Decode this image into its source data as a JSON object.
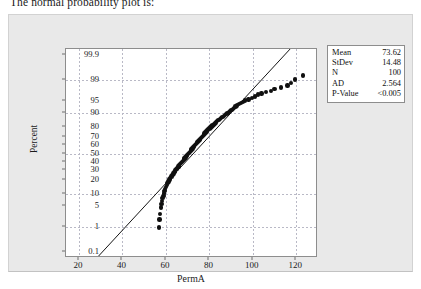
{
  "caption": "The normal probability plot is:",
  "chart_data": {
    "type": "scatter",
    "subtype": "normal-probability-plot",
    "title": "",
    "xlabel": "PermA",
    "ylabel": "Percent",
    "grid": true,
    "xlim": [
      14,
      130
    ],
    "xticks": [
      20,
      40,
      60,
      80,
      100,
      120
    ],
    "yticks": [
      0.1,
      1,
      5,
      10,
      20,
      30,
      40,
      50,
      60,
      70,
      80,
      90,
      95,
      99,
      99.9
    ],
    "ytick_labels": [
      "0.1",
      "1",
      "5",
      "10",
      "20",
      "30",
      "40",
      "50",
      "60",
      "70",
      "80",
      "90",
      "95",
      "99",
      "99.9"
    ],
    "ylim": [
      0.05,
      99.95
    ],
    "reference_line": {
      "label": "normal fit line",
      "mean": 73.62,
      "stdev": 14.48,
      "x_at_bottom": 29,
      "x_at_top": 118
    },
    "n_points": 100,
    "points": [
      {
        "x": 56.8,
        "y": 1.0
      },
      {
        "x": 57.0,
        "y": 1.9
      },
      {
        "x": 57.2,
        "y": 2.9
      },
      {
        "x": 57.6,
        "y": 4.5
      },
      {
        "x": 57.9,
        "y": 5.6
      },
      {
        "x": 58.2,
        "y": 6.8
      },
      {
        "x": 58.5,
        "y": 8.0
      },
      {
        "x": 58.8,
        "y": 9.2
      },
      {
        "x": 59.0,
        "y": 10.5
      },
      {
        "x": 59.3,
        "y": 11.8
      },
      {
        "x": 59.6,
        "y": 13.2
      },
      {
        "x": 60.0,
        "y": 14.6
      },
      {
        "x": 60.4,
        "y": 16.0
      },
      {
        "x": 60.8,
        "y": 17.5
      },
      {
        "x": 61.2,
        "y": 19.0
      },
      {
        "x": 61.6,
        "y": 20.5
      },
      {
        "x": 62.0,
        "y": 22.0
      },
      {
        "x": 62.5,
        "y": 23.5
      },
      {
        "x": 63.0,
        "y": 25.0
      },
      {
        "x": 63.4,
        "y": 26.5
      },
      {
        "x": 63.9,
        "y": 28.0
      },
      {
        "x": 64.3,
        "y": 29.5
      },
      {
        "x": 64.8,
        "y": 31.0
      },
      {
        "x": 65.2,
        "y": 32.5
      },
      {
        "x": 65.7,
        "y": 34.0
      },
      {
        "x": 66.1,
        "y": 35.4
      },
      {
        "x": 66.5,
        "y": 36.8
      },
      {
        "x": 67.0,
        "y": 38.2
      },
      {
        "x": 67.4,
        "y": 39.6
      },
      {
        "x": 67.8,
        "y": 41.0
      },
      {
        "x": 68.2,
        "y": 42.4
      },
      {
        "x": 68.6,
        "y": 43.8
      },
      {
        "x": 69.0,
        "y": 45.2
      },
      {
        "x": 69.4,
        "y": 46.6
      },
      {
        "x": 69.8,
        "y": 48.0
      },
      {
        "x": 70.2,
        "y": 49.4
      },
      {
        "x": 70.6,
        "y": 50.8
      },
      {
        "x": 71.0,
        "y": 52.2
      },
      {
        "x": 71.4,
        "y": 53.6
      },
      {
        "x": 71.8,
        "y": 55.0
      },
      {
        "x": 72.2,
        "y": 56.4
      },
      {
        "x": 72.6,
        "y": 57.8
      },
      {
        "x": 73.0,
        "y": 59.2
      },
      {
        "x": 73.4,
        "y": 60.5
      },
      {
        "x": 73.8,
        "y": 61.8
      },
      {
        "x": 74.2,
        "y": 63.0
      },
      {
        "x": 74.6,
        "y": 64.2
      },
      {
        "x": 75.0,
        "y": 65.4
      },
      {
        "x": 75.4,
        "y": 66.6
      },
      {
        "x": 75.8,
        "y": 67.8
      },
      {
        "x": 76.2,
        "y": 69.0
      },
      {
        "x": 76.6,
        "y": 70.1
      },
      {
        "x": 77.0,
        "y": 71.2
      },
      {
        "x": 77.4,
        "y": 72.3
      },
      {
        "x": 77.8,
        "y": 73.4
      },
      {
        "x": 78.2,
        "y": 74.5
      },
      {
        "x": 78.6,
        "y": 75.5
      },
      {
        "x": 79.0,
        "y": 76.5
      },
      {
        "x": 79.5,
        "y": 77.5
      },
      {
        "x": 80.0,
        "y": 78.5
      },
      {
        "x": 80.5,
        "y": 79.4
      },
      {
        "x": 81.0,
        "y": 80.3
      },
      {
        "x": 81.5,
        "y": 81.2
      },
      {
        "x": 82.0,
        "y": 82.1
      },
      {
        "x": 82.5,
        "y": 82.9
      },
      {
        "x": 83.0,
        "y": 83.7
      },
      {
        "x": 83.6,
        "y": 84.5
      },
      {
        "x": 84.2,
        "y": 85.3
      },
      {
        "x": 84.8,
        "y": 86.0
      },
      {
        "x": 85.4,
        "y": 86.7
      },
      {
        "x": 86.0,
        "y": 87.4
      },
      {
        "x": 86.6,
        "y": 88.1
      },
      {
        "x": 87.2,
        "y": 88.7
      },
      {
        "x": 87.8,
        "y": 89.3
      },
      {
        "x": 88.4,
        "y": 89.9
      },
      {
        "x": 89.0,
        "y": 90.5
      },
      {
        "x": 89.6,
        "y": 91.0
      },
      {
        "x": 90.2,
        "y": 91.5
      },
      {
        "x": 90.8,
        "y": 92.0
      },
      {
        "x": 91.4,
        "y": 92.5
      },
      {
        "x": 92.0,
        "y": 93.0
      },
      {
        "x": 92.8,
        "y": 93.5
      },
      {
        "x": 93.6,
        "y": 94.0
      },
      {
        "x": 94.5,
        "y": 94.4
      },
      {
        "x": 95.5,
        "y": 94.8
      },
      {
        "x": 96.5,
        "y": 95.2
      },
      {
        "x": 98.0,
        "y": 95.6
      },
      {
        "x": 99.5,
        "y": 96.0
      },
      {
        "x": 101.0,
        "y": 96.4
      },
      {
        "x": 102.5,
        "y": 96.8
      },
      {
        "x": 104.0,
        "y": 97.1
      },
      {
        "x": 106.0,
        "y": 97.4
      },
      {
        "x": 108.5,
        "y": 97.6
      },
      {
        "x": 110.0,
        "y": 97.9
      },
      {
        "x": 113.0,
        "y": 98.1
      },
      {
        "x": 116.0,
        "y": 98.4
      },
      {
        "x": 117.5,
        "y": 98.7
      },
      {
        "x": 119.5,
        "y": 99.0
      },
      {
        "x": 123.0,
        "y": 99.3
      }
    ]
  },
  "stats_box": {
    "rows": [
      {
        "key": "Mean",
        "value": "73.62"
      },
      {
        "key": "StDev",
        "value": "14.48"
      },
      {
        "key": "N",
        "value": "100"
      },
      {
        "key": "AD",
        "value": "2.564"
      },
      {
        "key": "P-Value",
        "value": "<0.005"
      }
    ]
  }
}
